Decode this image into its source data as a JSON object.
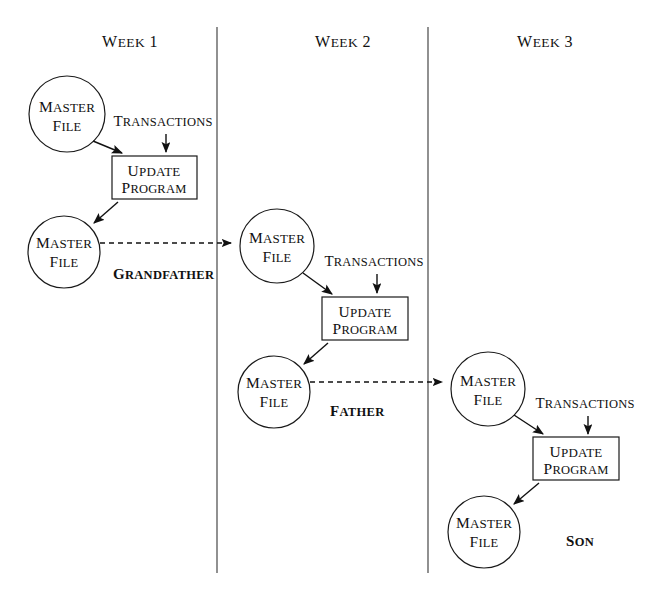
{
  "diagram": {
    "columns": [
      {
        "id": "week-1",
        "label": "Week 1",
        "header_x": 130,
        "divider_x": 217
      },
      {
        "id": "week-2",
        "label": "Week 2",
        "header_x": 343,
        "divider_x": 428
      },
      {
        "id": "week-3",
        "label": "Week 3",
        "header_x": 545,
        "divider_x": null
      }
    ],
    "labels": {
      "master_file_line1": "Master",
      "master_file_line2": "File",
      "update_program_line1": "Update",
      "update_program_line2": "Program",
      "transactions": "Transactions",
      "generation_grandfather": "Grandfather",
      "generation_father": "Father",
      "generation_son": "Son"
    },
    "colors": {
      "ink": "#111111",
      "divider": "#555555",
      "background": "#ffffff"
    },
    "cycles": [
      {
        "id": "cycle-week-1",
        "week": "Week 1",
        "input_master_file": {
          "cx": 67,
          "cy": 114,
          "r": 38
        },
        "update_program": {
          "x": 112,
          "y": 156,
          "w": 85,
          "h": 43
        },
        "output_master_file": {
          "cx": 64,
          "cy": 252,
          "r": 36
        },
        "transactions_label": {
          "x": 163,
          "y": 125
        },
        "generation_label": {
          "text": "Grandfather",
          "x": 113,
          "y": 275
        },
        "handoff_to": "cycle-week-2"
      },
      {
        "id": "cycle-week-2",
        "week": "Week 2",
        "input_master_file": {
          "cx": 277,
          "cy": 246,
          "r": 37
        },
        "update_program": {
          "x": 322,
          "y": 297,
          "w": 86,
          "h": 43
        },
        "output_master_file": {
          "cx": 274,
          "cy": 392,
          "r": 36
        },
        "transactions_label": {
          "x": 374,
          "y": 265
        },
        "generation_label": {
          "text": "Father",
          "x": 330,
          "y": 412
        },
        "handoff_to": "cycle-week-3"
      },
      {
        "id": "cycle-week-3",
        "week": "Week 3",
        "input_master_file": {
          "cx": 488,
          "cy": 389,
          "r": 37
        },
        "update_program": {
          "x": 533,
          "y": 437,
          "w": 86,
          "h": 43
        },
        "output_master_file": {
          "cx": 484,
          "cy": 532,
          "r": 36
        },
        "transactions_label": {
          "x": 585,
          "y": 407
        },
        "generation_label": {
          "text": "Son",
          "x": 566,
          "y": 542
        },
        "handoff_to": null
      }
    ]
  }
}
